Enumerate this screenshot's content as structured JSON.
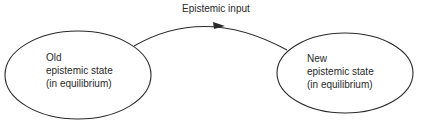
{
  "diagram": {
    "edge": {
      "label": "Epistemic input",
      "direction": "left-to-right"
    },
    "nodes": [
      {
        "id": "old",
        "lines": [
          "Old",
          "epistemic state",
          "(in equilibrium)"
        ]
      },
      {
        "id": "new",
        "lines": [
          "New",
          "epistemic state",
          "(in equilibrium)"
        ]
      }
    ],
    "colors": {
      "stroke": "#2a2a2a",
      "text": "#2a2a2a",
      "background": "#ffffff"
    }
  }
}
